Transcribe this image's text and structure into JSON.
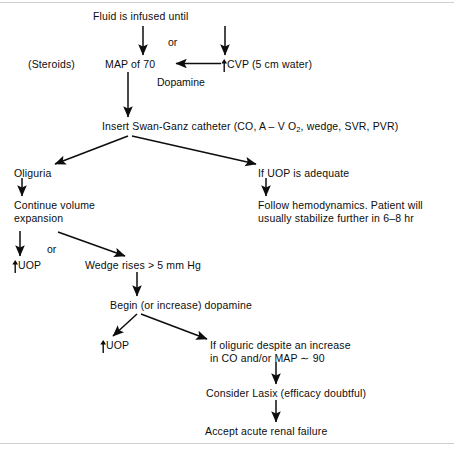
{
  "diagram": {
    "nodes": {
      "fluid_infused": "Fluid is infused until",
      "or_top": "or",
      "steroids": "(Steroids)",
      "map_of_70": "MAP of 70",
      "cvp": "CVP (5 cm water)",
      "cvp_arrow_glyph": "up-arrow",
      "dopamine": "Dopamine",
      "swan_ganz_pre": "Insert Swan-Ganz catheter (CO, A – V O",
      "swan_ganz_sub": "2",
      "swan_ganz_post": ", wedge, SVR, PVR)",
      "oliguria": "Oliguria",
      "continue_volume_expansion": "Continue volume\nexpansion",
      "uop_left": "UOP",
      "uop_left_glyph": "up-arrow",
      "or_mid": "or",
      "wedge_rises": "Wedge rises  >  5 mm Hg",
      "begin_dopamine": "Begin (or increase) dopamine",
      "uop_lower": "UOP",
      "uop_lower_glyph": "up-arrow",
      "if_oliguric": "If oliguric despite an increase\nin CO and/or MAP ∼ 90",
      "consider_lasix": "Consider Lasix (efficacy doubtful)",
      "accept_arf": "Accept acute renal failure",
      "if_uop_adequate": "If UOP is adequate",
      "follow_hemodynamics": "Follow hemodynamics. Patient will\nusually stabilize further in 6–8 hr"
    },
    "colors": {
      "ink": "#0d0d0d",
      "background": "#ffffff",
      "rule": "#cfcfcf"
    }
  }
}
